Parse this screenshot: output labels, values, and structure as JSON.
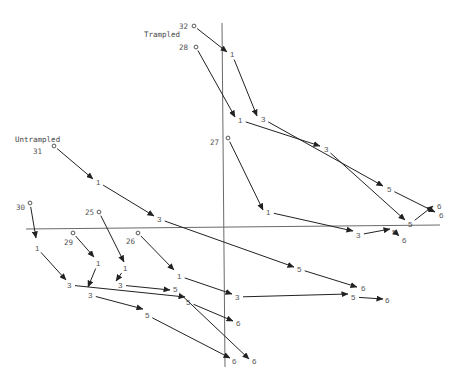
{
  "figure": {
    "group_labels": {
      "trampled": "Trampled",
      "untrampled": "Untrampled"
    },
    "origin_marker": "o",
    "trajectories": [
      {
        "plot": "32",
        "steps": [
          "1",
          "3",
          "5",
          "6"
        ]
      },
      {
        "plot": "28",
        "steps": [
          "1",
          "3",
          "5",
          "6"
        ]
      },
      {
        "plot": "27",
        "steps": [
          "1",
          "3",
          "5",
          "6"
        ]
      },
      {
        "plot": "31",
        "steps": [
          "1",
          "3",
          "5",
          "6"
        ]
      },
      {
        "plot": "30",
        "steps": [
          "1",
          "3",
          "5",
          "6"
        ]
      },
      {
        "plot": "29",
        "steps": [
          "1",
          "3",
          "5",
          "6"
        ]
      },
      {
        "plot": "25",
        "steps": [
          "1",
          "3",
          "5",
          "6"
        ]
      },
      {
        "plot": "26",
        "steps": [
          "1",
          "3",
          "5",
          "6"
        ]
      }
    ]
  },
  "colors": {
    "ink": "#222222",
    "axis": "#6a6a6a",
    "label": "#555555",
    "background": "#ffffff"
  }
}
